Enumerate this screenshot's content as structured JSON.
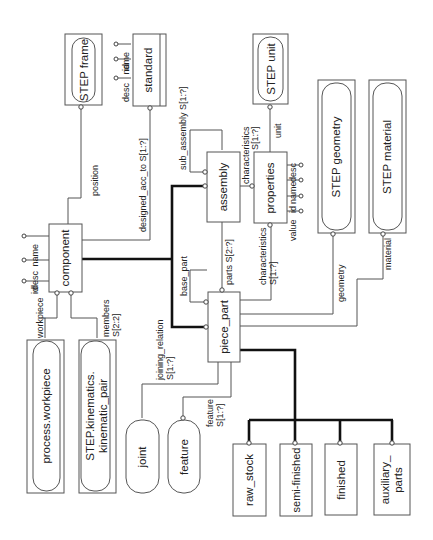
{
  "diagram": {
    "type": "EXPRESS-G entity diagram (rotated 90 degrees)",
    "external_types": [
      {
        "id": "step_frame",
        "label": "STEP frame"
      },
      {
        "id": "step_unit",
        "label": "STEP unit"
      },
      {
        "id": "step_geometry",
        "label": "STEP geometry"
      },
      {
        "id": "step_material",
        "label": "STEP material"
      },
      {
        "id": "process_workpiece",
        "label": "process.workpiece"
      },
      {
        "id": "step_kinematics",
        "label_line1": "STEP.kinematics.",
        "label_line2": "kinematic_pair"
      }
    ],
    "entities": {
      "standard": {
        "label": "standard",
        "attributes": [
          "desc",
          "id",
          "name"
        ]
      },
      "component": {
        "label": "component",
        "attributes": [
          "id",
          "desc",
          "name"
        ]
      },
      "assembly": {
        "label": "assembly"
      },
      "properties": {
        "label": "properties",
        "attributes": [
          "value",
          "id",
          "name",
          "desc"
        ]
      },
      "piece_part": {
        "label": "piece_part"
      },
      "joint": {
        "label": "joint"
      },
      "feature": {
        "label": "feature"
      },
      "raw_stock": {
        "label": "raw_stock"
      },
      "semi_finished": {
        "label": "semi-finished"
      },
      "finished": {
        "label": "finished"
      },
      "auxiliary_parts": {
        "label_line1": "auxiliary_",
        "label_line2": "parts"
      }
    },
    "relations": {
      "position": "position",
      "designed_acc_to": "designed_acc_to S[1:?]",
      "sub_assembly": "sub_assembly S[1:?]",
      "characteristics_assembly_1": "characteristics",
      "characteristics_assembly_2": "S[1:?]",
      "unit": "unit",
      "parts": "parts S[2:?]",
      "characteristics_piece_1": "characteristics",
      "characteristics_piece_2": "S[1:?]",
      "base_part": "base_part",
      "geometry": "geometry",
      "material": "material",
      "joining_relation_1": "joining_relation",
      "joining_relation_2": "S[1:?]",
      "feature_1": "feature",
      "feature_2": "S[1:?]",
      "workpiece": "workpiece",
      "members_1": "members",
      "members_2": "S[2:2]"
    }
  }
}
